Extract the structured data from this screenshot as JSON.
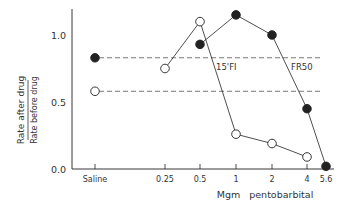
{
  "chart_data": {
    "type": "line",
    "title": "",
    "xlabel": "Mgm   pentobarbital",
    "ylabel_numerator": "Rate after drug",
    "ylabel_denominator": "Rate before drug",
    "x_scale": "log",
    "x_ticks": [
      "Saline",
      "0.25",
      "0.5",
      "1",
      "2",
      "4",
      "5.6"
    ],
    "y_ticks": [
      "0.0",
      "0.5",
      "1.0"
    ],
    "ylim": [
      0,
      1.2
    ],
    "grid": false,
    "series": [
      {
        "name": "15'FI",
        "marker": "open-circle",
        "saline_baseline": 0.58,
        "x": [
          0.25,
          0.5,
          1,
          2,
          4
        ],
        "values": [
          0.75,
          1.1,
          0.26,
          0.19,
          0.09
        ]
      },
      {
        "name": "FR50",
        "marker": "filled-circle",
        "saline_baseline": 0.83,
        "x": [
          0.5,
          1,
          2,
          4,
          5.6
        ],
        "values": [
          0.93,
          1.15,
          1.0,
          0.45,
          0.02
        ]
      }
    ],
    "annotations": [
      {
        "text": "15'FI",
        "near": "open series baseline"
      },
      {
        "text": "FR50",
        "near": "filled series baseline"
      }
    ]
  },
  "layout": {
    "x_positions": {
      "Saline": 95,
      "0.25": 165,
      "0.5": 200,
      "1": 236,
      "2": 272,
      "4": 307,
      "5.6": 326
    },
    "y_zero_px": 169,
    "px_per_unit": 134,
    "axis_left": 72,
    "axis_top": 9,
    "axis_right": 334,
    "dash_end": 320,
    "colors": {
      "ink": "#222222",
      "dash": "#555555",
      "background": "#ffffff"
    }
  }
}
